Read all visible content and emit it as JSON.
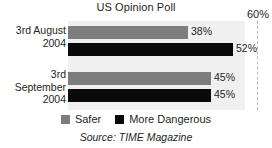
{
  "chart_data": {
    "type": "bar",
    "orientation": "horizontal",
    "title": "US Opinion Poll",
    "xlabel": "",
    "ylabel": "",
    "xlim": [
      0,
      60
    ],
    "axis_max_label": "60%",
    "grid": "single dashed vertical line at 60%",
    "legend_position": "bottom-center",
    "categories": [
      "3rd August\n2004",
      "3rd\nSeptember\n2004"
    ],
    "series": [
      {
        "name": "Safer",
        "color": "#7d7d7d",
        "values": [
          38,
          45
        ],
        "value_labels": [
          "38%",
          "45%"
        ]
      },
      {
        "name": "More Dangerous",
        "color": "#0a0a0a",
        "values": [
          52,
          45
        ],
        "value_labels": [
          "52%",
          "45%"
        ]
      }
    ],
    "source": "Source: TIME Magazine"
  },
  "chart": {
    "title": "US Opinion Poll",
    "axis_max_label": "60%",
    "source": "Source: TIME Magazine",
    "categories": [
      {
        "label": "3rd August\n2004"
      },
      {
        "label": "3rd\nSeptember\n2004"
      }
    ],
    "bars": [
      {
        "value_label": "38%",
        "series": "Safer"
      },
      {
        "value_label": "52%",
        "series": "More Dangerous"
      },
      {
        "value_label": "45%",
        "series": "Safer"
      },
      {
        "value_label": "45%",
        "series": "More Dangerous"
      }
    ],
    "legend": [
      {
        "label": "Safer",
        "color": "#7d7d7d"
      },
      {
        "label": "More Dangerous",
        "color": "#0a0a0a"
      }
    ]
  }
}
